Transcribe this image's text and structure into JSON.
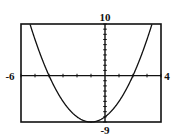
{
  "chart_data": {
    "type": "line",
    "title": "",
    "xlabel": "",
    "ylabel": "",
    "function": "f(x) = x^2 + 2x - 8",
    "xlim": [
      -6,
      4
    ],
    "ylim": [
      -9,
      10
    ],
    "xscale": 1,
    "yscale": 1,
    "grid": false,
    "legend": null,
    "tick_labels": {
      "xmin": "-6",
      "xmax": "4",
      "ymin": "-9",
      "ymax": "10"
    },
    "series": [
      {
        "name": "parabola",
        "color": "#111111",
        "x": [
          -5.36,
          -5,
          -4,
          -3,
          -2,
          -1,
          0,
          1,
          2,
          3,
          3.36
        ],
        "y": [
          10,
          7,
          0,
          -5,
          -8,
          -9,
          -8,
          -5,
          0,
          7,
          10
        ]
      }
    ],
    "key_points": {
      "x_intercepts": [
        -4,
        2
      ],
      "y_intercept": -8,
      "vertex": [
        -1,
        -9
      ]
    }
  },
  "viewport": {
    "box": {
      "left": 21,
      "top": 24,
      "right": 161,
      "bottom": 122
    },
    "stroke": "#111111",
    "background": "#ffffff"
  }
}
